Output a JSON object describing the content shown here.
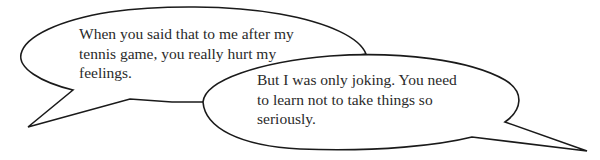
{
  "dialogue": {
    "bubbles": [
      {
        "speaker_position": "left",
        "lines": [
          "When you said that to me after my",
          "tennis game, you really hurt my",
          "feelings."
        ]
      },
      {
        "speaker_position": "right",
        "lines": [
          "But I was only joking. You need",
          "to learn not to take things so",
          "seriously."
        ]
      }
    ]
  },
  "style": {
    "outline_color": "#1a1a1a",
    "text_color": "#2a2a2a",
    "background": "#ffffff"
  }
}
